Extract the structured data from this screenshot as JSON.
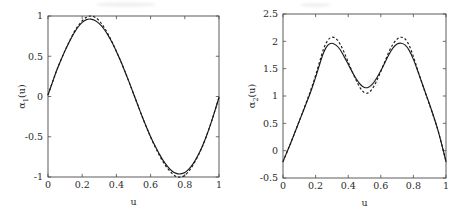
{
  "figure": {
    "background": "#ffffff",
    "ink_color": "#1a1a1a",
    "axis_color": "#4a4a4a"
  },
  "chart_data": [
    {
      "type": "line",
      "panel": "left",
      "title": "",
      "xlabel": "u",
      "ylabel": "α₁(u)",
      "ylabel_base": "α",
      "ylabel_sub": "1",
      "ylabel_tail": "(u)",
      "xlim": [
        0,
        1
      ],
      "ylim": [
        -1,
        1
      ],
      "grid": false,
      "legend": "none",
      "xticks": [
        0,
        0.2,
        0.4,
        0.6,
        0.8,
        1
      ],
      "xticklabels": [
        "0",
        "0.2",
        "0.4",
        "0.6",
        "0.8",
        "1"
      ],
      "yticks": [
        -1,
        -0.5,
        0,
        0.5,
        1
      ],
      "yticklabels": [
        "-1",
        "-0.5",
        "0",
        "0.5",
        "1"
      ],
      "x": [
        0,
        0.025,
        0.05,
        0.075,
        0.1,
        0.125,
        0.15,
        0.175,
        0.2,
        0.225,
        0.25,
        0.275,
        0.3,
        0.325,
        0.35,
        0.375,
        0.4,
        0.425,
        0.45,
        0.475,
        0.5,
        0.525,
        0.55,
        0.575,
        0.6,
        0.625,
        0.65,
        0.675,
        0.7,
        0.725,
        0.75,
        0.775,
        0.8,
        0.825,
        0.85,
        0.875,
        0.9,
        0.925,
        0.95,
        0.975,
        1
      ],
      "series": [
        {
          "name": "solid",
          "style": "solid",
          "values": [
            0.02,
            0.17,
            0.32,
            0.45,
            0.57,
            0.68,
            0.78,
            0.86,
            0.92,
            0.955,
            0.962,
            0.945,
            0.905,
            0.845,
            0.765,
            0.67,
            0.56,
            0.44,
            0.31,
            0.175,
            0.035,
            -0.105,
            -0.245,
            -0.375,
            -0.5,
            -0.61,
            -0.71,
            -0.8,
            -0.87,
            -0.925,
            -0.955,
            -0.962,
            -0.945,
            -0.9,
            -0.83,
            -0.74,
            -0.63,
            -0.5,
            -0.35,
            -0.185,
            -0.01
          ]
        },
        {
          "name": "dashed",
          "style": "dashed",
          "values": [
            0.02,
            0.17,
            0.32,
            0.45,
            0.575,
            0.685,
            0.79,
            0.875,
            0.94,
            0.985,
            1.0,
            0.985,
            0.94,
            0.87,
            0.78,
            0.675,
            0.56,
            0.44,
            0.31,
            0.175,
            0.035,
            -0.105,
            -0.245,
            -0.38,
            -0.505,
            -0.62,
            -0.725,
            -0.82,
            -0.895,
            -0.955,
            -0.995,
            -1.0,
            -0.98,
            -0.925,
            -0.845,
            -0.75,
            -0.635,
            -0.5,
            -0.35,
            -0.185,
            -0.01
          ]
        }
      ]
    },
    {
      "type": "line",
      "panel": "right",
      "title": "",
      "xlabel": "u",
      "ylabel": "α₂(u)",
      "ylabel_base": "α",
      "ylabel_sub": "2",
      "ylabel_tail": "(u)",
      "xlim": [
        0,
        1
      ],
      "ylim": [
        -0.5,
        2.5
      ],
      "grid": false,
      "legend": "none",
      "xticks": [
        0,
        0.2,
        0.4,
        0.6,
        0.8,
        1
      ],
      "xticklabels": [
        "0",
        "0.2",
        "0.4",
        "0.6",
        "0.8",
        "1"
      ],
      "yticks": [
        -0.5,
        0,
        0.5,
        1,
        1.5,
        2,
        2.5
      ],
      "yticklabels": [
        "-0.5",
        "0",
        "0.5",
        "1",
        "1.5",
        "2",
        "2.5"
      ],
      "x": [
        0,
        0.025,
        0.05,
        0.075,
        0.1,
        0.125,
        0.15,
        0.175,
        0.2,
        0.225,
        0.25,
        0.275,
        0.3,
        0.325,
        0.35,
        0.375,
        0.4,
        0.425,
        0.45,
        0.475,
        0.5,
        0.525,
        0.55,
        0.575,
        0.6,
        0.625,
        0.65,
        0.675,
        0.7,
        0.725,
        0.75,
        0.775,
        0.8,
        0.825,
        0.85,
        0.875,
        0.9,
        0.925,
        0.95,
        0.975,
        1
      ],
      "series": [
        {
          "name": "solid",
          "style": "solid",
          "values": [
            -0.2,
            -0.02,
            0.16,
            0.35,
            0.54,
            0.73,
            0.92,
            1.12,
            1.34,
            1.58,
            1.8,
            1.93,
            1.965,
            1.93,
            1.85,
            1.72,
            1.58,
            1.44,
            1.31,
            1.21,
            1.155,
            1.16,
            1.22,
            1.33,
            1.46,
            1.61,
            1.76,
            1.88,
            1.95,
            1.965,
            1.93,
            1.83,
            1.67,
            1.47,
            1.26,
            1.05,
            0.84,
            0.62,
            0.38,
            0.1,
            -0.2
          ]
        },
        {
          "name": "dashed",
          "style": "dashed",
          "values": [
            -0.2,
            -0.02,
            0.16,
            0.35,
            0.545,
            0.74,
            0.94,
            1.15,
            1.38,
            1.63,
            1.87,
            2.02,
            2.075,
            2.05,
            1.95,
            1.8,
            1.62,
            1.44,
            1.28,
            1.14,
            1.06,
            1.06,
            1.14,
            1.28,
            1.45,
            1.63,
            1.81,
            1.95,
            2.04,
            2.075,
            2.04,
            1.92,
            1.72,
            1.49,
            1.26,
            1.04,
            0.83,
            0.61,
            0.38,
            0.1,
            -0.2
          ]
        }
      ]
    }
  ]
}
